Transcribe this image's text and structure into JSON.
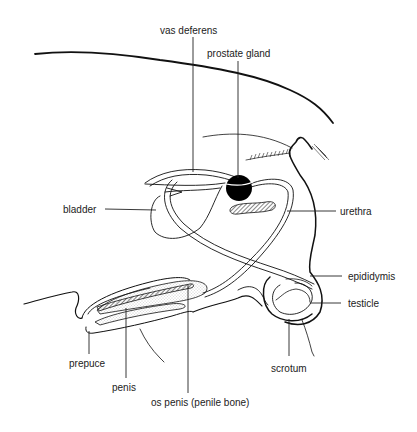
{
  "diagram": {
    "colors": {
      "line": "#111111",
      "text": "#222222",
      "background": "#ffffff",
      "prostate_fill": "#000000",
      "stipple": "#9a9a9a"
    },
    "labels": {
      "vas_deferens": "vas deferens",
      "prostate_gland": "prostate gland",
      "bladder": "bladder",
      "urethra": "urethra",
      "epididymis": "epididymis",
      "testicle": "testicle",
      "scrotum": "scrotum",
      "prepuce": "prepuce",
      "penis": "penis",
      "os_penis": "os penis (penile bone)"
    }
  }
}
